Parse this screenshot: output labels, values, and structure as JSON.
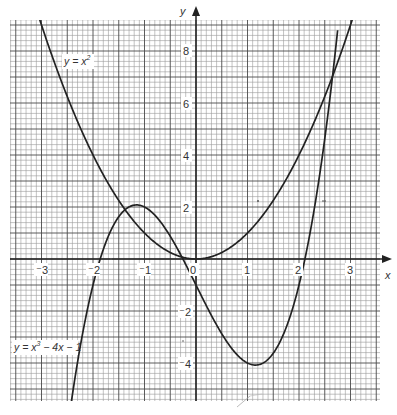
{
  "chart_data": {
    "type": "line",
    "title": "",
    "xlabel": "x",
    "ylabel": "y",
    "xlim": [
      -3.7,
      3.5
    ],
    "ylim": [
      -5.4,
      9.2
    ],
    "grid": true,
    "grid_minor": {
      "x_step": 0.1,
      "y_step": 0.2
    },
    "grid_major": {
      "x_step": 0.5,
      "y_step": 1
    },
    "x_ticks": [
      -3,
      -2,
      -1,
      0,
      1,
      2,
      3
    ],
    "x_tick_labels": [
      "⁻3",
      "⁻2",
      "⁻1",
      "0",
      "1",
      "2",
      "3"
    ],
    "y_ticks": [
      -4,
      -2,
      2,
      4,
      6,
      8
    ],
    "y_tick_labels": [
      "⁻4",
      "⁻2",
      "2",
      "4",
      "6",
      "8"
    ],
    "series": [
      {
        "name": "y = x²",
        "expression": "x^2",
        "x": [
          -3.0,
          -2.5,
          -2.0,
          -1.5,
          -1.0,
          -0.5,
          0.0,
          0.5,
          1.0,
          1.5,
          2.0,
          2.5,
          3.0
        ],
        "values": [
          9.0,
          6.25,
          4.0,
          2.25,
          1.0,
          0.25,
          0.0,
          0.25,
          1.0,
          2.25,
          4.0,
          6.25,
          9.0
        ]
      },
      {
        "name": "y = x³ − 4x − 1",
        "expression": "x^3 - 4x - 1",
        "x": [
          -2.4,
          -2.0,
          -1.5,
          -1.15,
          -1.0,
          -0.5,
          0.0,
          0.5,
          1.0,
          1.15,
          1.5,
          2.0,
          2.5,
          2.9
        ],
        "values": [
          -5.22,
          -1.0,
          1.63,
          2.08,
          2.0,
          0.88,
          -1.0,
          -2.88,
          -4.0,
          -4.08,
          -3.63,
          -1.0,
          4.63,
          11.79
        ]
      }
    ],
    "annotations": [
      {
        "text": "y = x²",
        "near": [
          -2.3,
          7.8
        ]
      },
      {
        "text": "y = x³ − 4x − 1",
        "near": [
          -3.5,
          -3.5
        ]
      }
    ]
  },
  "labels": {
    "x_axis": "x",
    "y_axis": "y",
    "eq_parabola_main": "y = x",
    "eq_parabola_sup": "2",
    "eq_cubic_main1": "y = x",
    "eq_cubic_sup": "3",
    "eq_cubic_main2": " − 4x − 1",
    "xt_m3": "⁻3",
    "xt_m2": "⁻2",
    "xt_m1": "⁻1",
    "xt_0": "0",
    "xt_1": "1",
    "xt_2": "2",
    "xt_3": "3",
    "yt_8": "8",
    "yt_6": "6",
    "yt_4": "4",
    "yt_2": "2",
    "yt_m2": "⁻2",
    "yt_m4": "⁻4"
  }
}
